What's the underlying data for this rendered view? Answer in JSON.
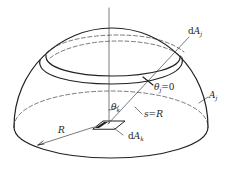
{
  "diagram": {
    "type": "hemisphere radiation geometry",
    "labels": {
      "dAj": {
        "prefix": "d",
        "main": "A",
        "sub": "j"
      },
      "theta_j": {
        "main": "θ",
        "sub": "j",
        "suffix": "=0"
      },
      "Aj": {
        "main": "A",
        "sub": "j"
      },
      "theta_k": {
        "main": "θ",
        "sub": "k"
      },
      "s_eq_R": "s=R",
      "R": "R",
      "dAk": {
        "prefix": "d",
        "main": "A",
        "sub": "k"
      }
    },
    "colors": {
      "stroke": "#222222",
      "background": "#ffffff"
    }
  }
}
